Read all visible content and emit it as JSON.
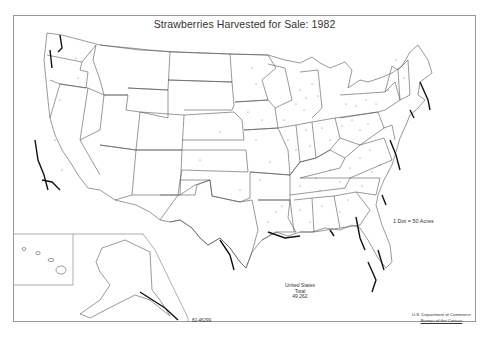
{
  "map": {
    "title": "Strawberries Harvested for Sale: 1982",
    "legend": "1 Dot = 50 Acres",
    "total": {
      "line1": "United States",
      "line2": "Total",
      "value": "49,262"
    },
    "map_code": "82-46299",
    "credit": {
      "line1": "U.S. Department of Commerce",
      "line2": "Bureau of the Census"
    },
    "insets": [
      "Alaska",
      "Hawaii"
    ],
    "dense_regions": [
      "California coast",
      "Washington / Oregon west",
      "Florida",
      "Gulf Coast (TX, LA, MS, AL)",
      "Chesapeake / Mid-Atlantic",
      "New England coast",
      "Michigan",
      "Ohio valley"
    ]
  }
}
